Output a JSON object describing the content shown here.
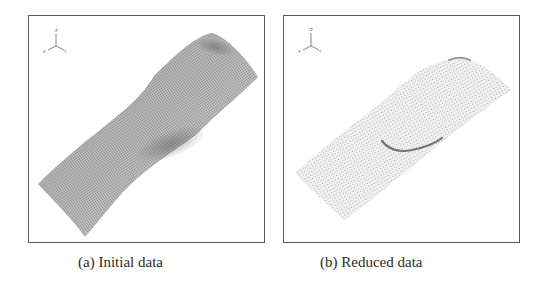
{
  "figure": {
    "panels": [
      {
        "id": "a",
        "caption": "(a) Initial data",
        "description": "dense point cloud of a curved surface",
        "axis_triad": {
          "z": "Z",
          "x": "X",
          "y": "Y"
        }
      },
      {
        "id": "b",
        "caption": "(b) Reduced data",
        "description": "reduced (sparser) point cloud of the same surface",
        "axis_triad": {
          "z": "Z",
          "x": "X",
          "y": "Y"
        }
      }
    ],
    "colors": {
      "frame": "#5a5a5a",
      "dense_points": "#9a9a9a",
      "sparse_points": "#bdbdbd",
      "ridge": "#5f5f5f"
    }
  }
}
